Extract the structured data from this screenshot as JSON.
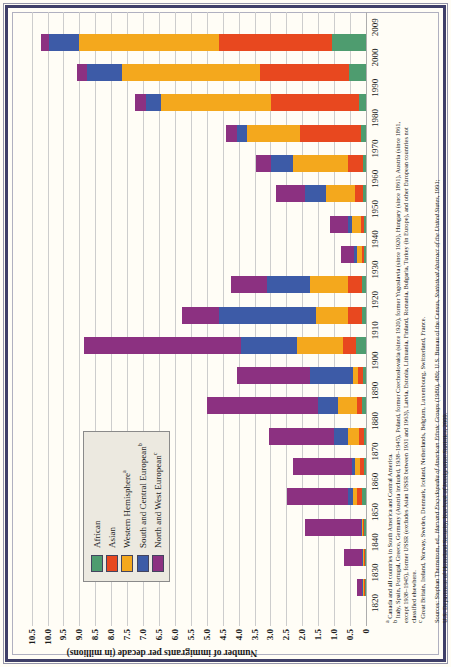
{
  "figure": {
    "background": "#fffdf6",
    "frame_colors": {
      "outer": "#9494a8",
      "dark": "#3f3f68",
      "inner": "#b0b0c0"
    },
    "grid_color": "#cdcdcd",
    "axis_line_color": "#adadad",
    "text_color": "#1b1b1b",
    "orientation_note": "entire figure printed rotated 90 degrees counterclockwise"
  },
  "legend": {
    "background": "#ece9e0",
    "border_color": "#8a8a8a",
    "items": [
      {
        "label": "African",
        "sup": "",
        "color": "#4E9C6F"
      },
      {
        "label": "Asian",
        "sup": "",
        "color": "#E8481F"
      },
      {
        "label": "Western Hemisphere",
        "sup": "a",
        "color": "#F4A81D"
      },
      {
        "label": "South and Central European",
        "sup": "b",
        "color": "#3D5BA7"
      },
      {
        "label": "North and West European",
        "sup": "c",
        "color": "#8C3181"
      }
    ]
  },
  "chart_data": {
    "type": "bar",
    "stacked": true,
    "title": "",
    "ylabel": "Number of immigrants per decade (in millions)",
    "ylim": [
      0,
      10.5
    ],
    "ytick_step": 0.5,
    "y_tick_labels": [
      "0",
      "0.5",
      "1.0",
      "1.5",
      "2.0",
      "2.5",
      "3.0",
      "3.5",
      "4.0",
      "4.5",
      "5.0",
      "5.5",
      "6.0",
      "6.5",
      "7.0",
      "7.5",
      "8.0",
      "8.5",
      "9.0",
      "9.5",
      "10.0",
      "10.5"
    ],
    "x_tick_labels": [
      "1820",
      "1830",
      "1840",
      "1850",
      "1860",
      "1870",
      "1880",
      "1890",
      "1900",
      "1910",
      "1920",
      "1930",
      "1940",
      "1950",
      "1960",
      "1970",
      "1980",
      "1990",
      "2000",
      "2009"
    ],
    "categories": [
      "1820s",
      "1830s",
      "1840s",
      "1850s",
      "1860s",
      "1870s",
      "1880s",
      "1890s",
      "1900s",
      "1910s",
      "1920s",
      "1930s",
      "1940s",
      "1950s",
      "1960s",
      "1970s",
      "1980s",
      "1990s",
      "2000s"
    ],
    "stack_order_note": "stacked from axis outward: African, Asian, Western Hemisphere, South and Central European, North and West European",
    "grid": true,
    "legend_position": "upper left of plot",
    "series": [
      {
        "name": "African",
        "color": "#4E9C6F",
        "values": [
          0.03,
          0.04,
          0.06,
          0.12,
          0.06,
          0.06,
          0.12,
          0.1,
          0.3,
          0.12,
          0.13,
          0.05,
          0.06,
          0.08,
          0.1,
          0.15,
          0.22,
          0.54,
          1.08
        ]
      },
      {
        "name": "Asian",
        "color": "#E8481F",
        "values": [
          0.02,
          0.02,
          0.02,
          0.15,
          0.12,
          0.16,
          0.15,
          0.15,
          0.42,
          0.45,
          0.45,
          0.09,
          0.1,
          0.27,
          0.45,
          1.92,
          2.75,
          2.79,
          3.52
        ]
      },
      {
        "name": "Western Hemisphere",
        "color": "#F4A81D",
        "values": [
          0.05,
          0.05,
          0.06,
          0.15,
          0.15,
          0.35,
          0.6,
          0.15,
          1.44,
          1.0,
          1.17,
          0.15,
          0.27,
          0.9,
          1.73,
          1.66,
          3.46,
          4.32,
          4.4
        ]
      },
      {
        "name": "South and Central European",
        "color": "#3D5BA7",
        "values": [
          0.02,
          0.02,
          0.03,
          0.15,
          0.12,
          0.42,
          0.63,
          1.36,
          1.75,
          3.05,
          1.36,
          0.09,
          0.14,
          0.65,
          0.71,
          0.32,
          0.47,
          1.12,
          0.95
        ]
      },
      {
        "name": "North and West European",
        "color": "#8C3181",
        "values": [
          0.15,
          0.55,
          1.75,
          1.9,
          1.85,
          2.05,
          3.5,
          2.3,
          4.95,
          1.15,
          1.13,
          0.42,
          0.56,
          0.94,
          0.47,
          0.34,
          0.34,
          0.3,
          0.26
        ]
      }
    ]
  },
  "footnotes": {
    "lines": [
      {
        "sup": "a",
        "text": " Canada and all countries in South America and Central America."
      },
      {
        "sup": "b",
        "text": " Italy, Spain, Portugal, Greece, Germany (Austria included, 1938–1945), Poland, former Czechoslovakia (since 1920), former Yugoslavia (since 1920), Hungary (since 1861), Austria (since 1861,"
      },
      {
        "sup": "",
        "text": "except 1938–1945), former USSR (excludes Asian USSR between 1931 and 1963), Latvia, Estonia, Lithuania, Finland, Romania, Bulgaria, Turkey (in Europe), and other European countries not"
      },
      {
        "sup": "",
        "text": "classified elsewhere."
      },
      {
        "sup": "c",
        "text": " Great Britain, Ireland, Norway, Sweden, Denmark, Iceland, Netherlands, Belgium, Luxembourg, Switzerland, France."
      }
    ],
    "sources": [
      {
        "parts": [
          {
            "t": "Sources: Stephan Thernstrom, ed., "
          },
          {
            "t": "Harvard Encyclopedia of American Ethnic Groups",
            "i": true
          },
          {
            "t": " (1980), 480; U.S. Bureau of the Census, "
          },
          {
            "t": "Statistical Abstract of the United States",
            "i": true
          },
          {
            "t": ", 1991;"
          }
        ]
      },
      {
        "parts": [
          {
            "t": "U.S. Department of Homeland Security, "
          },
          {
            "t": "Yearbook of Immigration Statistics",
            "i": true
          },
          {
            "t": ", 2009."
          }
        ]
      }
    ]
  }
}
